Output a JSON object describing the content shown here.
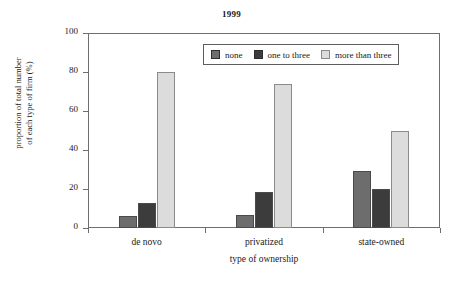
{
  "chart_data": {
    "type": "bar",
    "title": "1999",
    "xlabel": "type of ownership",
    "ylabel": "proportion of total number of each type of firm (%)",
    "ylabel_lines": [
      "proportion of total number",
      "of each type of firm (%)"
    ],
    "categories": [
      "de novo",
      "privatized",
      "state-owned"
    ],
    "series": [
      {
        "name": "none",
        "values": [
          6,
          6.5,
          29
        ],
        "color": "#6d6d6d"
      },
      {
        "name": "one to three",
        "values": [
          13,
          18.5,
          20
        ],
        "color": "#3c3c3c"
      },
      {
        "name": "more than three",
        "values": [
          80,
          74,
          50
        ],
        "color": "#dcdcdc"
      }
    ],
    "ylim": [
      0,
      100
    ],
    "yticks": [
      0,
      20,
      40,
      60,
      80,
      100
    ],
    "ytick_labels": [
      "0",
      "20",
      "40",
      "60",
      "80",
      "100"
    ],
    "grid": false,
    "legend_position": "top-center",
    "legend_entries": [
      "none",
      "one to three",
      "more than three"
    ]
  },
  "colors": {
    "frame": "#6f6f6f",
    "bar_edge": "#4a4a4a",
    "background": "#ffffff",
    "text": "#1a1a1a"
  }
}
